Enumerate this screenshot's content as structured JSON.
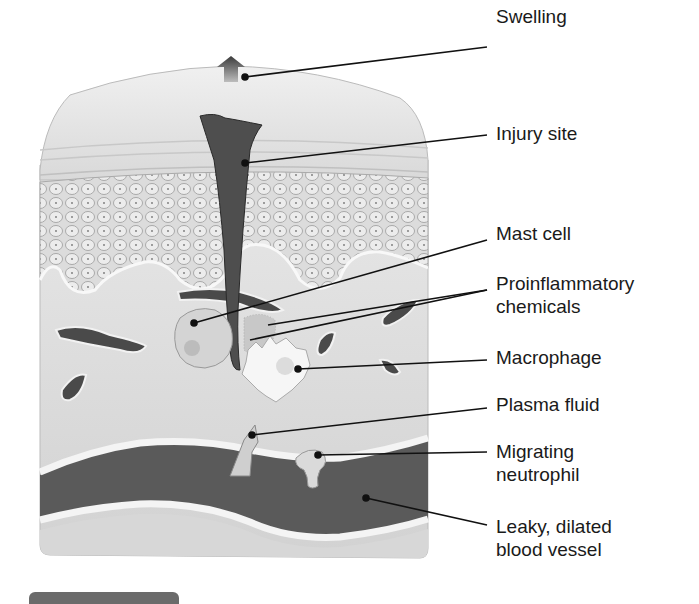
{
  "figure": {
    "colors": {
      "background": "#ffffff",
      "tissue_light": "#e4e4e4",
      "tissue_mid": "#cfcfcf",
      "epidermis_cells": "#d8d8d8",
      "wound": "#4a4a4a",
      "vessel_lumen": "#5a5a5a",
      "label_text": "#1a1a1a",
      "leader_line": "#111111"
    }
  },
  "labels": [
    {
      "id": "swelling",
      "text": "Swelling"
    },
    {
      "id": "injury_site",
      "text": "Injury site"
    },
    {
      "id": "mast_cell",
      "text": "Mast cell"
    },
    {
      "id": "proinflammatory_chemicals",
      "lines": [
        "Proinflammatory",
        "chemicals"
      ]
    },
    {
      "id": "macrophage",
      "text": "Macrophage"
    },
    {
      "id": "plasma_fluid",
      "text": "Plasma fluid"
    },
    {
      "id": "migrating_neutrophil",
      "lines": [
        "Migrating",
        "neutrophil"
      ]
    },
    {
      "id": "leaky_vessel",
      "lines": [
        "Leaky, dilated",
        "blood vessel"
      ]
    }
  ]
}
